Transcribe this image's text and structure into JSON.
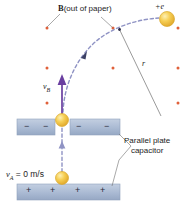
{
  "figure": {
    "title_label": "B (out of paper)",
    "field_symbol": "B",
    "field_note": "(out of paper)",
    "charge_label": "+e",
    "radius_label": "r",
    "velocity_b_symbol": "v",
    "velocity_b_subscript": "B",
    "velocity_a_symbol": "v",
    "velocity_a_subscript": "A",
    "velocity_a_value": "= 0 m/s",
    "capacitor_label_line1": "Parallel plate",
    "capacitor_label_line2": "capacitor",
    "plate_top_signs": [
      "−",
      "−",
      "−",
      "−"
    ],
    "plate_bottom_signs": [
      "+",
      "+",
      "+",
      "+"
    ],
    "field_dots": [
      {
        "x": 47,
        "y": 28
      },
      {
        "x": 113,
        "y": 28
      },
      {
        "x": 178,
        "y": 28
      },
      {
        "x": 47,
        "y": 68
      },
      {
        "x": 113,
        "y": 68
      },
      {
        "x": 178,
        "y": 68
      },
      {
        "x": 47,
        "y": 103
      },
      {
        "x": 178,
        "y": 103
      }
    ],
    "particles": [
      {
        "name": "charge-at-b-top-right",
        "x": 167,
        "y": 19,
        "r": 7.5
      },
      {
        "name": "charge-at-b",
        "x": 62,
        "y": 120,
        "r": 6.5
      },
      {
        "name": "charge-at-a",
        "x": 62,
        "y": 178,
        "r": 6.5
      }
    ],
    "colors": {
      "plate_fill": "#aebdd4",
      "plate_stroke": "#8fa2bd",
      "field_dot": "#e0603a",
      "trajectory": "#8f93c4",
      "velocity_arrow": "#6a3fa0",
      "particle": "#f2c141",
      "particle_edge": "#d9a72c",
      "leader_line": "#6f6f6f",
      "text": "#1c1c1c"
    }
  }
}
